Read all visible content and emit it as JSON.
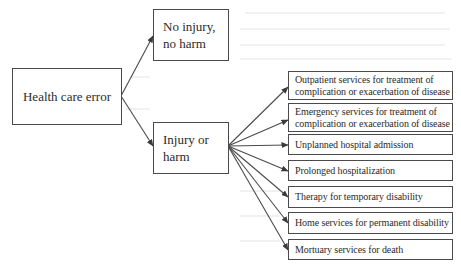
{
  "diagram": {
    "root": {
      "label": "Health care error"
    },
    "branches": [
      {
        "id": "no-injury",
        "label": "No injury,\nno harm"
      },
      {
        "id": "injury",
        "label": "Injury or\nharm"
      }
    ],
    "outcomes": [
      {
        "label": "Outpatient services for treatment of\ncomplication or exacerbation of disease"
      },
      {
        "label": "Emergency services for treatment of\ncomplication or exacerbation of disease"
      },
      {
        "label": "Unplanned hospital admission"
      },
      {
        "label": "Prolonged hospitalization"
      },
      {
        "label": "Therapy for temporary disability"
      },
      {
        "label": "Home services for permanent disability"
      },
      {
        "label": "Mortuary services for death"
      }
    ],
    "colors": {
      "line": "#4a4a4a",
      "text": "#2b2b2b",
      "background": "#ffffff"
    }
  }
}
